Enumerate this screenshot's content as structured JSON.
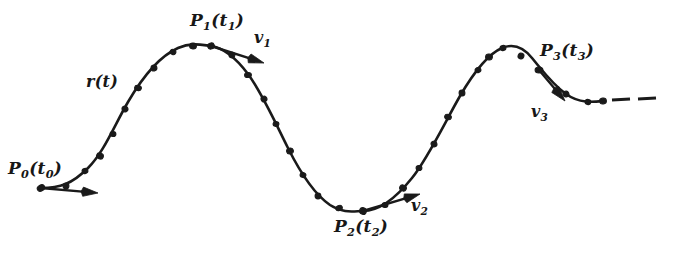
{
  "figure": {
    "background_color": "#ffffff",
    "ink_color": "#1a1a1a",
    "width": 673,
    "height": 263
  },
  "labels": {
    "curve": {
      "name": "r",
      "arg": "t",
      "text": "r(t)",
      "x": 86,
      "y": 74
    },
    "p0": {
      "point": "P",
      "index": "0",
      "param": "t",
      "text": "P0(t0)",
      "x": 8,
      "y": 160
    },
    "p1": {
      "point": "P",
      "index": "1",
      "param": "t",
      "text": "P1(t1)",
      "x": 190,
      "y": 12
    },
    "p2": {
      "point": "P",
      "index": "2",
      "param": "t",
      "text": "P2(t2)",
      "x": 334,
      "y": 218
    },
    "p3": {
      "point": "P",
      "index": "3",
      "param": "t",
      "text": "P3(t3)",
      "x": 540,
      "y": 42
    },
    "v1": {
      "vector": "v",
      "index": "1",
      "text": "v1",
      "x": 254,
      "y": 30
    },
    "v2": {
      "vector": "v",
      "index": "2",
      "text": "v2",
      "x": 411,
      "y": 198
    },
    "v3": {
      "vector": "v",
      "index": "3",
      "text": "v3",
      "x": 531,
      "y": 104
    }
  },
  "chart_data": {
    "type": "line",
    "xlabel": "",
    "ylabel": "",
    "xlim": [
      0,
      673
    ],
    "ylim": [
      263,
      0
    ],
    "grid": false,
    "legend": null,
    "curve_path": "M 41,188 C 60,188 72,184 88,168 C 104,152 114,126 128,102 C 142,78 160,56 178,48 C 192,42 202,45 211,46 C 224,48 236,58 248,74 C 262,93 274,120 288,148 C 300,172 314,194 330,205 C 344,214 354,211 363,211 C 380,211 396,198 412,178 C 428,158 444,124 460,96 C 474,72 488,54 502,48 C 514,43 524,48 532,58 C 542,70 552,84 566,94 C 580,104 594,102 603,101",
    "dashes": [
      {
        "x1": 612,
        "y1": 100,
        "x2": 630,
        "y2": 99
      },
      {
        "x1": 638,
        "y1": 99,
        "x2": 656,
        "y2": 98
      }
    ],
    "sample_points": [
      {
        "x": 41,
        "y": 188,
        "label": "P0",
        "marked": true
      },
      {
        "x": 66,
        "y": 186
      },
      {
        "x": 85,
        "y": 171
      },
      {
        "x": 100,
        "y": 156
      },
      {
        "x": 113,
        "y": 134
      },
      {
        "x": 125,
        "y": 109
      },
      {
        "x": 138,
        "y": 88
      },
      {
        "x": 154,
        "y": 68
      },
      {
        "x": 173,
        "y": 52
      },
      {
        "x": 193,
        "y": 46
      },
      {
        "x": 211,
        "y": 46,
        "label": "P1",
        "marked": true
      },
      {
        "x": 232,
        "y": 55
      },
      {
        "x": 248,
        "y": 75
      },
      {
        "x": 264,
        "y": 99
      },
      {
        "x": 276,
        "y": 124
      },
      {
        "x": 290,
        "y": 151
      },
      {
        "x": 303,
        "y": 175
      },
      {
        "x": 318,
        "y": 196
      },
      {
        "x": 339,
        "y": 208
      },
      {
        "x": 363,
        "y": 211,
        "label": "P2",
        "marked": true
      },
      {
        "x": 385,
        "y": 205
      },
      {
        "x": 403,
        "y": 188
      },
      {
        "x": 419,
        "y": 168
      },
      {
        "x": 434,
        "y": 144
      },
      {
        "x": 448,
        "y": 117
      },
      {
        "x": 462,
        "y": 93
      },
      {
        "x": 478,
        "y": 70
      },
      {
        "x": 489,
        "y": 57
      },
      {
        "x": 503,
        "y": 48
      },
      {
        "x": 521,
        "y": 56
      },
      {
        "x": 539,
        "y": 70,
        "label": "P3",
        "marked": true
      },
      {
        "x": 566,
        "y": 94
      },
      {
        "x": 588,
        "y": 102
      },
      {
        "x": 603,
        "y": 101
      }
    ],
    "vectors": [
      {
        "name": "v0",
        "from": {
          "x": 41,
          "y": 188
        },
        "to": {
          "x": 98,
          "y": 193
        },
        "direction": "right-horizontal",
        "labeled": false
      },
      {
        "name": "v1",
        "from": {
          "x": 211,
          "y": 46
        },
        "to": {
          "x": 264,
          "y": 63
        },
        "direction": "down-right",
        "labeled": true
      },
      {
        "name": "v2",
        "from": {
          "x": 363,
          "y": 211
        },
        "to": {
          "x": 420,
          "y": 194
        },
        "direction": "up-right",
        "labeled": true
      },
      {
        "name": "v3",
        "from": {
          "x": 539,
          "y": 70
        },
        "to": {
          "x": 565,
          "y": 101
        },
        "direction": "down-right",
        "labeled": true
      }
    ]
  }
}
